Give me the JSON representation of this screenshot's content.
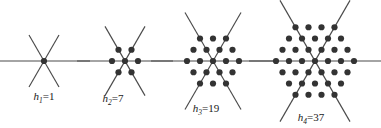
{
  "diagram": {
    "background_color": "#ffffff",
    "dot_color": "#333333",
    "line_color": "#4a4a4a",
    "label_color": "#1a1a1a",
    "figures": [
      {
        "id": "fig-1",
        "symbol": "h",
        "subscript": "1",
        "equals": "=",
        "value": "1",
        "label": "h1=1",
        "rings": 0,
        "dot_count": 1,
        "center_x": 44,
        "center_y": 61,
        "spacing": 13,
        "ray_length": 30,
        "h_line_half": 46,
        "label_x": 44,
        "label_y": 100,
        "rows": [
          {
            "y_offset": 0,
            "count": 1
          }
        ]
      },
      {
        "id": "fig-2",
        "symbol": "h",
        "subscript": "2",
        "equals": "=",
        "value": "7",
        "label": "h2=7",
        "rings": 1,
        "dot_count": 7,
        "center_x": 125,
        "center_y": 61,
        "spacing": 13,
        "ray_length": 40,
        "h_line_half": 48,
        "label_x": 113,
        "label_y": 102,
        "rows": [
          {
            "y_offset": -1,
            "count": 2
          },
          {
            "y_offset": 0,
            "count": 3
          },
          {
            "y_offset": 1,
            "count": 2
          }
        ]
      },
      {
        "id": "fig-3",
        "symbol": "h",
        "subscript": "3",
        "equals": "=",
        "value": "19",
        "label": "h3=19",
        "rings": 2,
        "dot_count": 19,
        "center_x": 213,
        "center_y": 61,
        "spacing": 13,
        "ray_length": 56,
        "h_line_half": 62,
        "label_x": 206,
        "label_y": 112,
        "rows": [
          {
            "y_offset": -2,
            "count": 3
          },
          {
            "y_offset": -1,
            "count": 4
          },
          {
            "y_offset": 0,
            "count": 5
          },
          {
            "y_offset": 1,
            "count": 4
          },
          {
            "y_offset": 2,
            "count": 3
          }
        ]
      },
      {
        "id": "fig-4",
        "symbol": "h",
        "subscript": "4",
        "equals": "=",
        "value": "37",
        "label": "h4=37",
        "rings": 3,
        "dot_count": 37,
        "center_x": 315,
        "center_y": 61,
        "spacing": 13,
        "ray_length": 70,
        "h_line_half": 66,
        "label_x": 311,
        "label_y": 121,
        "rows": [
          {
            "y_offset": -3,
            "count": 4
          },
          {
            "y_offset": -2,
            "count": 5
          },
          {
            "y_offset": -1,
            "count": 6
          },
          {
            "y_offset": 0,
            "count": 7
          },
          {
            "y_offset": 1,
            "count": 6
          },
          {
            "y_offset": 2,
            "count": 5
          },
          {
            "y_offset": 3,
            "count": 4
          }
        ]
      }
    ]
  }
}
